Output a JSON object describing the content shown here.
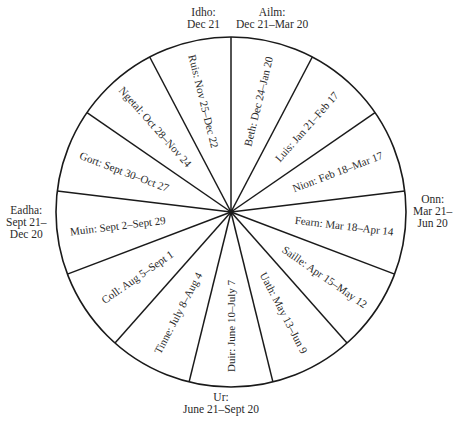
{
  "diagram": {
    "type": "ogham-tree-calendar-wheel",
    "center": [
      231,
      212
    ],
    "radius": 175,
    "line_color": "#1a1a1a",
    "sectors": [
      {
        "name": "Beth",
        "label": "Beth: Dec 24–Jan 20"
      },
      {
        "name": "Luis",
        "label": "Luis: Jan 21–Feb 17"
      },
      {
        "name": "Nion",
        "label": "Nion: Feb 18–Mar 17"
      },
      {
        "name": "Fearn",
        "label": "Fearn: Mar 18–Apr 14"
      },
      {
        "name": "Saille",
        "label": "Saille: Apr 15–May 12"
      },
      {
        "name": "Uath",
        "label": "Uath: May 13–Jun 9"
      },
      {
        "name": "Duir",
        "label": "Duir: June 10–July 7"
      },
      {
        "name": "Tinne",
        "label": "Tinne: July 8–Aug 4"
      },
      {
        "name": "Coll",
        "label": "Coll: Aug 5–Sept 1"
      },
      {
        "name": "Muin",
        "label": "Muin: Sept 2–Sept 29"
      },
      {
        "name": "Gort",
        "label": "Gort: Sept 30–Oct 27"
      },
      {
        "name": "Ngetal",
        "label": "Ngetal: Oct 28–Nov 24"
      },
      {
        "name": "Ruis",
        "label": "Ruis: Nov 25–Dec 22"
      }
    ],
    "outer_labels": {
      "idho": {
        "line1": "Idho:",
        "line2": "Dec 21"
      },
      "ailm": {
        "line1": "Ailm:",
        "line2": "Dec 21–Mar 20"
      },
      "onn": {
        "line1": "Onn:",
        "line2": "Mar 21–",
        "line3": "Jun 20"
      },
      "ur": {
        "line1": "Ur:",
        "line2": "June 21–Sept 20"
      },
      "eadha": {
        "line1": "Eadha:",
        "line2": "Sept 21–",
        "line3": "Dec 20"
      }
    }
  }
}
